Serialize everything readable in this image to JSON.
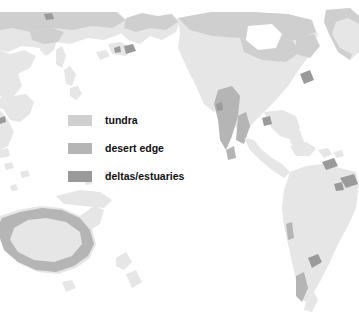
{
  "figure": {
    "kind": "world-map",
    "projection": "pacific-centred equirectangular",
    "clipped_caption": "",
    "ocean_color": "#ffffff",
    "land_color": "#e6e6e6",
    "page_background": "#ffffff"
  },
  "legend": {
    "items": [
      {
        "label": "tundra",
        "color": "#cfcfcf"
      },
      {
        "label": "desert edge",
        "color": "#b5b5b5"
      },
      {
        "label": "deltas/estuaries",
        "color": "#9a9a9a"
      }
    ]
  },
  "map_regions": {
    "tundra_note": "northern Siberia, Alaska, northern Canada, Greenland coast",
    "desert_edge_note": "northern Mexico / southwest USA, interior Australia rim, Patagonia",
    "deltas_note": "Amazon, Orinoco, Rio de la Plata, St Lawrence, Lena, Yukon"
  }
}
